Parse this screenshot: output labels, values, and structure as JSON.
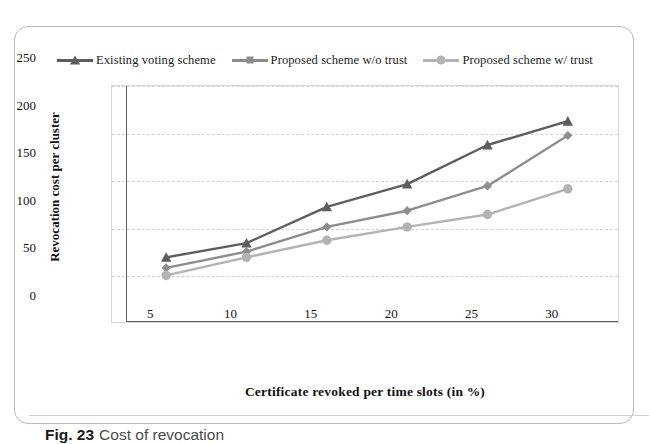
{
  "figure": {
    "caption_number": "Fig. 23",
    "caption_text": "Cost of revocation"
  },
  "chart_data": {
    "type": "line",
    "title": "",
    "xlabel": "Certificate revoked per time slots (in %)",
    "ylabel": "Revocation cost per cluster",
    "categories": [
      5,
      10,
      15,
      20,
      25,
      30
    ],
    "x_tick_labels": [
      "5",
      "10",
      "15",
      "20",
      "25",
      "30"
    ],
    "y_tick_labels": [
      "0",
      "50",
      "100",
      "150",
      "200",
      "250"
    ],
    "y_ticks": [
      0,
      50,
      100,
      150,
      200,
      250
    ],
    "ylim": [
      0,
      250
    ],
    "grid": "horizontal-dashed",
    "legend_position": "top-center",
    "series": [
      {
        "name": "Existing voting scheme",
        "marker": "triangle",
        "color": "#5d5d5d",
        "values": [
          70,
          85,
          123,
          147,
          188,
          213
        ]
      },
      {
        "name": "Proposed  scheme w/o trust",
        "marker": "diamond",
        "color": "#8d8d8d",
        "values": [
          59,
          76,
          102,
          119,
          145,
          198
        ]
      },
      {
        "name": "Proposed  scheme w/ trust",
        "marker": "circle",
        "color": "#b3b3b3",
        "values": [
          51,
          70,
          88,
          102,
          115,
          142
        ]
      }
    ]
  }
}
